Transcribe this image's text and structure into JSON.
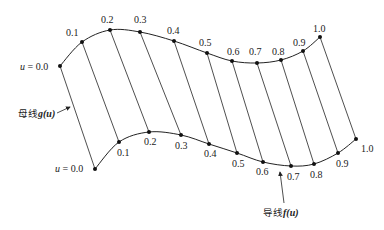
{
  "diagram": {
    "type": "ruled-surface",
    "colors": {
      "stroke": "#222222",
      "background": "#ffffff"
    },
    "top_curve": {
      "start_label": "u = 0.0",
      "points": [
        {
          "u": "0.0",
          "x": 60,
          "y": 66,
          "lx": null,
          "ly": null
        },
        {
          "u": "0.1",
          "x": 82,
          "y": 42,
          "lx": 66,
          "ly": 36
        },
        {
          "u": "0.2",
          "x": 110,
          "y": 30,
          "lx": 101,
          "ly": 23
        },
        {
          "u": "0.3",
          "x": 140,
          "y": 32,
          "lx": 134,
          "ly": 23
        },
        {
          "u": "0.4",
          "x": 174,
          "y": 41,
          "lx": 167,
          "ly": 34
        },
        {
          "u": "0.5",
          "x": 207,
          "y": 53,
          "lx": 199,
          "ly": 46
        },
        {
          "u": "0.6",
          "x": 232,
          "y": 61,
          "lx": 227,
          "ly": 55
        },
        {
          "u": "0.7",
          "x": 257,
          "y": 63,
          "lx": 249,
          "ly": 55
        },
        {
          "u": "0.8",
          "x": 281,
          "y": 60,
          "lx": 272,
          "ly": 55
        },
        {
          "u": "0.9",
          "x": 303,
          "y": 51,
          "lx": 293,
          "ly": 46
        },
        {
          "u": "1.0",
          "x": 320,
          "y": 37,
          "lx": 313,
          "ly": 32
        }
      ]
    },
    "bottom_curve": {
      "start_label": "u = 0.0",
      "points": [
        {
          "u": "0.0",
          "x": 95,
          "y": 169,
          "lx": null,
          "ly": null
        },
        {
          "u": "0.1",
          "x": 119,
          "y": 142,
          "lx": 117,
          "ly": 156
        },
        {
          "u": "0.2",
          "x": 149,
          "y": 132,
          "lx": 144,
          "ly": 145
        },
        {
          "u": "0.3",
          "x": 181,
          "y": 135,
          "lx": 175,
          "ly": 149
        },
        {
          "u": "0.4",
          "x": 209,
          "y": 144,
          "lx": 204,
          "ly": 157
        },
        {
          "u": "0.5",
          "x": 237,
          "y": 153,
          "lx": 232,
          "ly": 167
        },
        {
          "u": "0.6",
          "x": 263,
          "y": 162,
          "lx": 256,
          "ly": 175
        },
        {
          "u": "0.7",
          "x": 291,
          "y": 166,
          "lx": 287,
          "ly": 180
        },
        {
          "u": "0.8",
          "x": 314,
          "y": 164,
          "lx": 310,
          "ly": 178
        },
        {
          "u": "0.9",
          "x": 338,
          "y": 153,
          "lx": 336,
          "ly": 167
        },
        {
          "u": "1.0",
          "x": 356,
          "y": 139,
          "lx": 361,
          "ly": 152
        }
      ]
    },
    "labels": {
      "top_start": "u = 0.0",
      "bottom_start": "u = 0.0",
      "generatrix_cn": "母线",
      "generatrix_fn": "g(u)",
      "directrix_cn": "导线",
      "directrix_fn": "f(u)"
    }
  }
}
